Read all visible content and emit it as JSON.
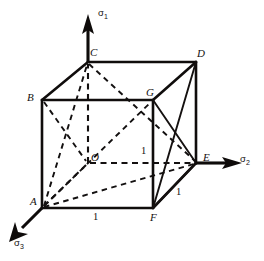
{
  "figure": {
    "background_color": "#ffffff",
    "line_color": "#111111",
    "width": 264,
    "height": 261
  },
  "axes": [
    {
      "id": "sigma1",
      "name": "sigma-1-axis",
      "symbol": "σ",
      "subscript": "1",
      "direction": "up",
      "label_x": 98,
      "label_y": 8
    },
    {
      "id": "sigma2",
      "name": "sigma-2-axis",
      "symbol": "σ",
      "subscript": "2",
      "direction": "right",
      "label_x": 240,
      "label_y": 154
    },
    {
      "id": "sigma3",
      "name": "sigma-3-axis",
      "symbol": "σ",
      "subscript": "3",
      "direction": "down-left",
      "label_x": 14,
      "label_y": 238
    }
  ],
  "vertices": [
    {
      "id": "A",
      "label": "A",
      "x": 42,
      "y": 208,
      "label_x": 30,
      "label_y": 196
    },
    {
      "id": "B",
      "label": "B",
      "x": 42,
      "y": 100,
      "label_x": 27,
      "label_y": 92
    },
    {
      "id": "C",
      "label": "C",
      "x": 88,
      "y": 62,
      "label_x": 90,
      "label_y": 47
    },
    {
      "id": "D",
      "label": "D",
      "x": 196,
      "y": 62,
      "label_x": 197,
      "label_y": 48
    },
    {
      "id": "E",
      "label": "E",
      "x": 196,
      "y": 163,
      "label_x": 203,
      "label_y": 152
    },
    {
      "id": "F",
      "label": "F",
      "x": 153,
      "y": 208,
      "label_x": 150,
      "label_y": 212
    },
    {
      "id": "G",
      "label": "G",
      "x": 153,
      "y": 100,
      "label_x": 146,
      "label_y": 87
    },
    {
      "id": "O",
      "label": "O",
      "x": 88,
      "y": 163,
      "label_x": 91,
      "label_y": 152
    }
  ],
  "dimension_labels": [
    {
      "id": "len-af",
      "text": "1",
      "x": 93,
      "y": 212,
      "edge": "A-F"
    },
    {
      "id": "len-fe",
      "text": "1",
      "x": 176,
      "y": 187,
      "edge": "F-E"
    },
    {
      "id": "len-og",
      "text": "1",
      "x": 141,
      "y": 146,
      "edge": "G-F"
    }
  ],
  "edges": {
    "visible": [
      "B-C",
      "C-D",
      "B-G",
      "G-D",
      "B-A",
      "D-E",
      "A-F",
      "F-E",
      "F-D",
      "G-E",
      "G-F",
      "F-G"
    ],
    "hidden": [
      "O-C",
      "O-E",
      "O-A",
      "A-C",
      "A-G",
      "A-E",
      "C-E",
      "B-O"
    ]
  },
  "notes": {
    "description": "Cube of unit edge length drawn in principal stress coordinate system with hidden edges dashed."
  }
}
